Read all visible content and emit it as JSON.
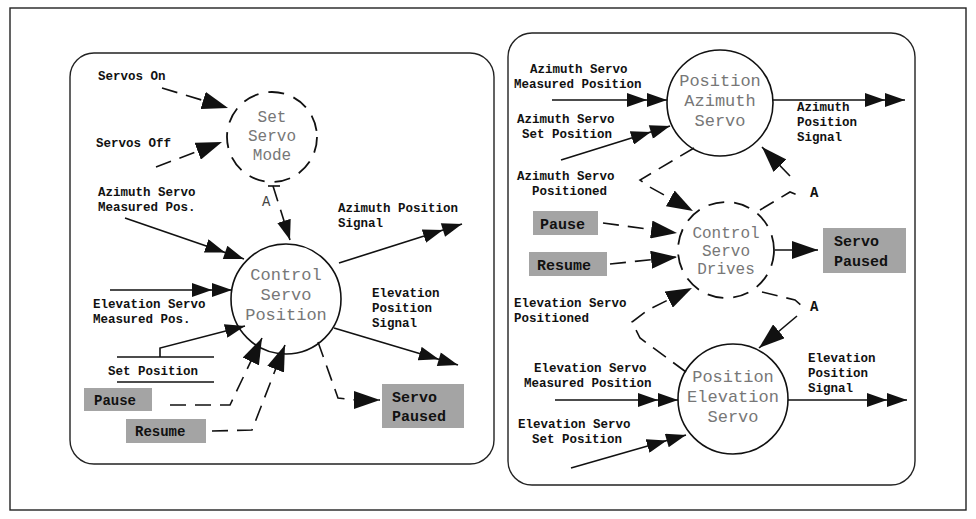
{
  "figure": {
    "outer_frame": true,
    "left_panel": {
      "processes": {
        "set_servo_mode": [
          "Set",
          "Servo",
          "Mode"
        ],
        "control_servo_position": [
          "Control",
          "Servo",
          "Position"
        ]
      },
      "inputs": {
        "servos_on": "Servos On",
        "servos_off": "Servos Off",
        "azimuth_measured": [
          "Azimuth Servo",
          "Measured Pos."
        ],
        "elevation_measured": [
          "Elevation Servo",
          "Measured Pos."
        ],
        "set_position": "Set Position",
        "pause": "Pause",
        "resume": "Resume"
      },
      "outputs": {
        "azimuth_signal": [
          "Azimuth Position",
          "Signal"
        ],
        "elevation_signal": [
          "Elevation",
          "Position",
          "Signal"
        ],
        "servo_paused": [
          "Servo",
          "Paused"
        ]
      },
      "connector_label": "A"
    },
    "right_panel": {
      "processes": {
        "position_azimuth_servo": [
          "Position",
          "Azimuth",
          "Servo"
        ],
        "control_servo_drives": [
          "Control",
          "Servo",
          "Drives"
        ],
        "position_elevation_servo": [
          "Position",
          "Elevation",
          "Servo"
        ]
      },
      "inputs": {
        "azimuth_measured": [
          "Azimuth Servo",
          "Measured Position"
        ],
        "azimuth_set": [
          "Azimuth Servo",
          "Set Position"
        ],
        "azimuth_positioned": [
          "Azimuth Servo",
          "Positioned"
        ],
        "pause": "Pause",
        "resume": "Resume",
        "elevation_positioned": [
          "Elevation Servo",
          "Positioned"
        ],
        "elevation_measured": [
          "Elevation Servo",
          "Measured Position"
        ],
        "elevation_set": [
          "Elevation Servo",
          "Set Position"
        ]
      },
      "outputs": {
        "azimuth_signal": [
          "Azimuth",
          "Position",
          "Signal"
        ],
        "elevation_signal": [
          "Elevation",
          "Position",
          "Signal"
        ],
        "servo_paused": [
          "Servo",
          "Paused"
        ]
      },
      "connector_labels": [
        "A",
        "A"
      ]
    },
    "colors": {
      "line": "#111111",
      "process_text": "#777777",
      "grey_box": "#a4a4a4",
      "background": "#ffffff"
    }
  }
}
